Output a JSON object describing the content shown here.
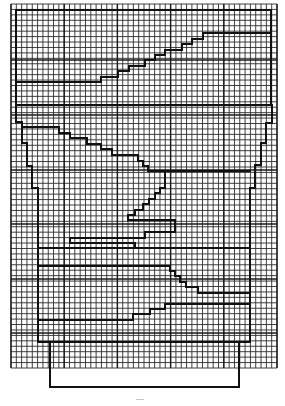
{
  "diagram": {
    "grid": {
      "x0": 11,
      "y0": 4,
      "x1": 277,
      "y1": 368,
      "columns": 50,
      "rows": 67,
      "major_every": 10,
      "major_x": [
        11,
        64.2,
        117.4,
        170.6,
        223.8,
        277
      ],
      "major_y": [
        60,
        115,
        170,
        224,
        279,
        333
      ],
      "line_color": "#2a2a2a"
    },
    "shapes": [
      {
        "name": "outer-top-frame",
        "points": "16,104 16,10 271,10 271,104"
      },
      {
        "name": "upper-stair-line",
        "points": "16,82 101,82 101,77 118,77 118,71 129,71 129,66 145,66 145,60 155,60 155,55 165,55 165,50 182,50 182,44 192,44 192,39 203,39 203,33 271,33"
      },
      {
        "name": "abacus-divider",
        "points": "16,105 272,105"
      },
      {
        "name": "capital-left-profile",
        "points": "16,105 16,122 22,122 22,143 27,143 27,166 32,166 32,188 38,188 38,342"
      },
      {
        "name": "capital-right-profile",
        "points": "272,105 272,123 266,123 266,143 261,143 261,165 255,165 255,188 250,188 250,342"
      },
      {
        "name": "inner-stair-down",
        "points": "22,127 59,127 59,133 70,133 70,138 87,138 87,144 101,144 101,149 112,149 112,155 138,155 138,161 143,161 143,166 148,166 148,171 250,171"
      },
      {
        "name": "hook-stair",
        "points": "165,171 165,188 160,188 160,193 155,193 155,199 149,199 149,204 143,204 143,210 135,210 135,215 128,215 128,220"
      },
      {
        "name": "hook-arm",
        "points": "128,220 175,220 175,232 145,232 145,238 70,238 70,243 135,243 135,248"
      },
      {
        "name": "shaft-line-1",
        "points": "38,248 250,248"
      },
      {
        "name": "lower-stair-down",
        "points": "38,266 170,266 170,271 175,271 175,276 180,276 180,282 186,282 186,287 198,287 198,293 250,293"
      },
      {
        "name": "lower-stair-up",
        "points": "38,320 133,320 133,314 150,314 150,309 165,309 165,304 250,304"
      },
      {
        "name": "body-bottom",
        "points": "38,342 250,342"
      },
      {
        "name": "base-block",
        "points": "50,342 50,387 239,387 239,342"
      }
    ],
    "page_mark": "–"
  }
}
